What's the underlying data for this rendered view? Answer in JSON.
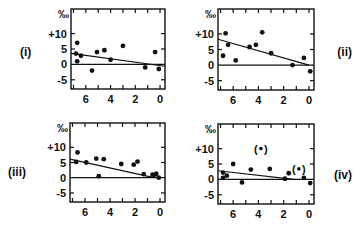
{
  "chart_data": [
    {
      "type": "scatter",
      "panel_label": "(i)",
      "unit_label": "‰",
      "yticks": [
        "+10",
        "5",
        "0",
        "-5"
      ],
      "xticks": [
        "6",
        "4",
        "2",
        "0"
      ],
      "xlim": [
        7.2,
        -0.4
      ],
      "ylim": [
        -8,
        18
      ],
      "points": [
        [
          6.7,
          7
        ],
        [
          6.8,
          3.5
        ],
        [
          6.7,
          1
        ],
        [
          6.4,
          2.8
        ],
        [
          5.5,
          -2
        ],
        [
          5.1,
          4
        ],
        [
          4.5,
          4.6
        ],
        [
          4.0,
          1.5
        ],
        [
          3.0,
          6
        ],
        [
          1.2,
          -1
        ],
        [
          0.4,
          4
        ],
        [
          0.1,
          -1.5
        ]
      ],
      "fit_line": [
        [
          7.2,
          3.6
        ],
        [
          -0.4,
          -0.6
        ]
      ],
      "zero_line": true
    },
    {
      "type": "scatter",
      "panel_label": "(ii)",
      "unit_label": "‰",
      "yticks": [
        "+10",
        "5",
        "0",
        "-5"
      ],
      "xticks": [
        "6",
        "4",
        "2",
        "0"
      ],
      "xlim": [
        7.2,
        -0.4
      ],
      "ylim": [
        -8,
        18
      ],
      "points": [
        [
          6.6,
          10.2
        ],
        [
          6.8,
          3
        ],
        [
          6.4,
          6.5
        ],
        [
          5.8,
          1.5
        ],
        [
          4.7,
          5.8
        ],
        [
          4.2,
          6.5
        ],
        [
          3.7,
          10.5
        ],
        [
          3.0,
          3.8
        ],
        [
          1.3,
          0
        ],
        [
          0.4,
          2.3
        ],
        [
          -0.1,
          -2
        ]
      ],
      "fit_line": [
        [
          7.2,
          8.3
        ],
        [
          0,
          0
        ]
      ],
      "zero_line": true
    },
    {
      "type": "scatter",
      "panel_label": "(iii)",
      "unit_label": "‰",
      "yticks": [
        "+10",
        "5",
        "0",
        "-5"
      ],
      "xticks": [
        "6",
        "4",
        "2",
        "0"
      ],
      "xlim": [
        7.2,
        -0.4
      ],
      "ylim": [
        -8,
        18
      ],
      "points": [
        [
          6.6,
          8.3
        ],
        [
          6.7,
          5.2
        ],
        [
          5.9,
          5
        ],
        [
          5.1,
          6.3
        ],
        [
          4.9,
          0.5
        ],
        [
          4.5,
          6.1
        ],
        [
          3.1,
          4.5
        ],
        [
          2.1,
          4.3
        ],
        [
          1.8,
          5.3
        ],
        [
          1.3,
          1.2
        ],
        [
          0.6,
          1
        ],
        [
          0.5,
          0.7
        ],
        [
          0.3,
          1.3
        ],
        [
          0.1,
          0
        ]
      ],
      "fit_line": [
        [
          7.2,
          6.1
        ],
        [
          0.5,
          0
        ]
      ],
      "zero_line": true
    },
    {
      "type": "scatter",
      "panel_label": "(iv)",
      "unit_label": "‰",
      "yticks": [
        "+10",
        "5",
        "0",
        "-5"
      ],
      "xticks": [
        "6",
        "4",
        "2",
        "0"
      ],
      "xlim": [
        7.2,
        -0.4
      ],
      "ylim": [
        -8,
        18
      ],
      "points": [
        [
          6.8,
          0.5
        ],
        [
          6.8,
          2.2
        ],
        [
          6.5,
          1.2
        ],
        [
          6.0,
          5
        ],
        [
          5.3,
          -1
        ],
        [
          4.6,
          3.2
        ],
        [
          3.1,
          3.4
        ],
        [
          1.9,
          0.2
        ],
        [
          1.6,
          2
        ],
        [
          0.4,
          0.5
        ],
        [
          -0.1,
          -1.2
        ]
      ],
      "bracketed_points": [
        [
          3.8,
          10
        ],
        [
          0.8,
          3.4
        ]
      ],
      "fit_line": [
        [
          7.2,
          2.8
        ],
        [
          1.2,
          0
        ]
      ],
      "zero_line": true
    }
  ]
}
